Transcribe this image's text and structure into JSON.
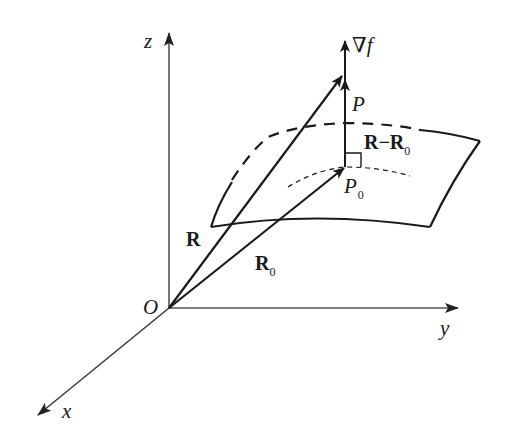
{
  "figure": {
    "axes": {
      "x_label": "x",
      "y_label": "y",
      "z_label": "z",
      "origin_label": "O"
    },
    "points": {
      "P": "P",
      "P0": "P",
      "P0_sub": "0"
    },
    "vectors": {
      "gradient": "∇f",
      "R": "R",
      "R0": "R",
      "R0_sub": "0",
      "diff_main": "R−R",
      "diff_sub": "0"
    },
    "colors": {
      "ink": "#1a1a1a",
      "axis": "#555555",
      "background": "#ffffff"
    }
  }
}
